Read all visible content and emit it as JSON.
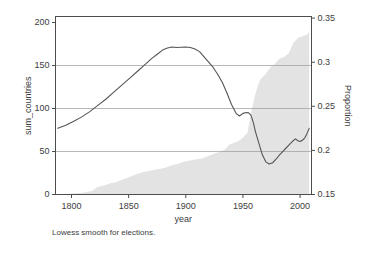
{
  "chart_data": {
    "type": "line",
    "title": "",
    "caption": "Lowess smooth for elections.",
    "xlabel": "year",
    "ylabel": "sum_countries",
    "y2label": "Proportion",
    "xlim": [
      1786,
      2010
    ],
    "ylim": [
      0,
      207
    ],
    "y2lim": [
      0.15,
      0.3518
    ],
    "grid": true,
    "gridlines_left": [
      50,
      100,
      150
    ],
    "gridlines_right": [
      0.2,
      0.25,
      0.3
    ],
    "legend_position": "none",
    "xticks": [
      1800,
      1850,
      1900,
      1950,
      2000
    ],
    "xtick_labels": [
      "1800",
      "1850",
      "1900",
      "1950",
      "2000"
    ],
    "yticks": [
      0,
      50,
      100,
      150,
      200
    ],
    "ytick_labels": [
      "0",
      "50",
      "100",
      "150",
      "200"
    ],
    "y2ticks": [
      0.15,
      0.2,
      0.25,
      0.3,
      0.35
    ],
    "y2tick_labels": [
      "0.15",
      "0.2",
      "0.25",
      "0.3",
      "0.35"
    ],
    "colors": {
      "line": "#555555",
      "area_fill": "#e3e3e3",
      "frame": "#4d4d4d",
      "grid": "#999999",
      "text": "#3d3d3d"
    },
    "series": [
      {
        "name": "Proportion (lowess smooth)",
        "axis": "right",
        "type": "line",
        "x": [
          1788,
          1795,
          1802,
          1809,
          1816,
          1823,
          1830,
          1837,
          1844,
          1851,
          1858,
          1865,
          1870,
          1875,
          1880,
          1884,
          1888,
          1892,
          1896,
          1900,
          1904,
          1908,
          1912,
          1916,
          1920,
          1924,
          1928,
          1932,
          1936,
          1940,
          1944,
          1947,
          1950,
          1953,
          1955,
          1957,
          1959,
          1961,
          1964,
          1967,
          1970,
          1973,
          1976,
          1979,
          1982,
          1985,
          1988,
          1991,
          1994,
          1996,
          1998,
          2000,
          2002,
          2004,
          2006,
          2008
        ],
        "y": [
          0.225,
          0.2285,
          0.233,
          0.238,
          0.244,
          0.251,
          0.258,
          0.266,
          0.274,
          0.282,
          0.29,
          0.298,
          0.304,
          0.309,
          0.314,
          0.316,
          0.3172,
          0.3166,
          0.317,
          0.3172,
          0.3166,
          0.315,
          0.312,
          0.306,
          0.3,
          0.294,
          0.286,
          0.277,
          0.265,
          0.252,
          0.242,
          0.239,
          0.242,
          0.243,
          0.2425,
          0.24,
          0.232,
          0.221,
          0.208,
          0.195,
          0.187,
          0.1845,
          0.186,
          0.19,
          0.195,
          0.199,
          0.203,
          0.207,
          0.211,
          0.213,
          0.211,
          0.21,
          0.2115,
          0.214,
          0.219,
          0.225
        ]
      },
      {
        "name": "sum_countries",
        "axis": "left",
        "type": "area",
        "x": [
          1788,
          1800,
          1810,
          1818,
          1822,
          1826,
          1830,
          1834,
          1838,
          1842,
          1846,
          1850,
          1854,
          1858,
          1862,
          1866,
          1870,
          1874,
          1878,
          1882,
          1886,
          1890,
          1894,
          1898,
          1902,
          1906,
          1910,
          1914,
          1918,
          1922,
          1926,
          1930,
          1934,
          1938,
          1942,
          1946,
          1950,
          1954,
          1958,
          1960,
          1962,
          1964,
          1966,
          1970,
          1974,
          1978,
          1982,
          1986,
          1990,
          1994,
          1998,
          2002,
          2006,
          2008
        ],
        "y": [
          0,
          1,
          2,
          4,
          8,
          10,
          11,
          13,
          14,
          16,
          18,
          20,
          22,
          24,
          26,
          27,
          28,
          29,
          30,
          31,
          33,
          35,
          36,
          38,
          39,
          40,
          41,
          42,
          44,
          46,
          48,
          50,
          52,
          58,
          60,
          62,
          66,
          72,
          100,
          112,
          122,
          130,
          135,
          140,
          148,
          152,
          158,
          160,
          164,
          176,
          182,
          184,
          186,
          189
        ]
      }
    ]
  }
}
